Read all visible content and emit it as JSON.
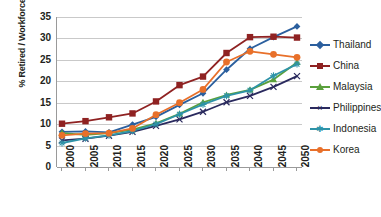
{
  "chart_data": {
    "type": "line",
    "title": "",
    "xlabel": "",
    "ylabel": "% Retired / Workforce",
    "x": [
      2000,
      2005,
      2010,
      2015,
      2020,
      2025,
      2030,
      2035,
      2040,
      2045,
      2050
    ],
    "xtick_labels": [
      "2000",
      "2005",
      "2010",
      "2015",
      "2020",
      "2025",
      "2030",
      "2035",
      "2040",
      "2045",
      "2050"
    ],
    "ytick_labels": [
      "0",
      "5",
      "10",
      "15",
      "20",
      "25",
      "30",
      "35"
    ],
    "yticks": [
      0,
      5,
      10,
      15,
      20,
      25,
      30,
      35
    ],
    "ylim": [
      0,
      35
    ],
    "grid": true,
    "legend_position": "right",
    "series": [
      {
        "name": "Thailand",
        "color": "#2b5f9e",
        "marker": "diamond",
        "values": [
          8.2,
          8.3,
          8.1,
          9.9,
          11.7,
          14.5,
          17.2,
          22.7,
          27.6,
          30.3,
          32.8
        ]
      },
      {
        "name": "China",
        "color": "#8f2222",
        "marker": "square",
        "values": [
          10.1,
          10.7,
          11.6,
          12.5,
          15.3,
          19.1,
          21.1,
          26.6,
          30.3,
          30.4,
          30.2
        ]
      },
      {
        "name": "Malaysia",
        "color": "#5aa03c",
        "marker": "triangle",
        "values": [
          7.9,
          7.5,
          7.9,
          8.7,
          10.2,
          12.4,
          15.1,
          16.8,
          18.0,
          20.4,
          24.4
        ]
      },
      {
        "name": "Philippines",
        "color": "#2a2a5e",
        "marker": "x",
        "values": [
          6.2,
          6.6,
          7.3,
          8.2,
          9.6,
          11.1,
          12.9,
          15.1,
          16.6,
          18.7,
          21.2
        ]
      },
      {
        "name": "Indonesia",
        "color": "#2e93a8",
        "marker": "asterisk",
        "values": [
          5.6,
          6.7,
          7.4,
          8.4,
          10.0,
          12.3,
          14.6,
          16.6,
          17.9,
          21.3,
          24.0
        ]
      },
      {
        "name": "Korea",
        "color": "#e8702a",
        "marker": "circle",
        "values": [
          7.4,
          7.8,
          7.9,
          9.0,
          12.2,
          15.0,
          18.1,
          24.5,
          27.0,
          26.3,
          25.6
        ]
      }
    ]
  }
}
